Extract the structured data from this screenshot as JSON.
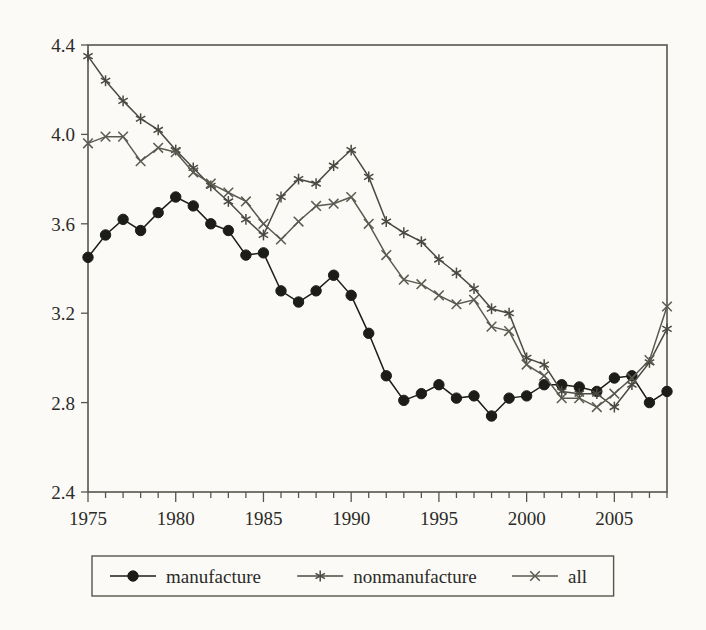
{
  "chart_data": {
    "type": "line",
    "title": "",
    "subtitle": "",
    "xlabel": "",
    "ylabel": "",
    "xlim": [
      1975,
      2008
    ],
    "ylim": [
      2.4,
      4.4
    ],
    "yticks": [
      2.4,
      2.8,
      3.2,
      3.6,
      4.0,
      4.4
    ],
    "ytick_labels": [
      "2.4",
      "2.8",
      "3.2",
      "3.6",
      "4.0",
      "4.4"
    ],
    "xticks": [
      1975,
      1980,
      1985,
      1990,
      1995,
      2000,
      2005
    ],
    "xtick_labels": [
      "1975",
      "1980",
      "1985",
      "1990",
      "1995",
      "2000",
      "2005"
    ],
    "minor_xtick_interval": 1,
    "grid": false,
    "legend_position": "bottom",
    "x": [
      1975,
      1976,
      1977,
      1978,
      1979,
      1980,
      1981,
      1982,
      1983,
      1984,
      1985,
      1986,
      1987,
      1988,
      1989,
      1990,
      1991,
      1992,
      1993,
      1994,
      1995,
      1996,
      1997,
      1998,
      1999,
      2000,
      2001,
      2002,
      2003,
      2004,
      2005,
      2006,
      2007,
      2008
    ],
    "series": [
      {
        "name": "manufacture",
        "marker": "filled-circle",
        "color": "#1c1c18",
        "values": [
          3.45,
          3.55,
          3.62,
          3.57,
          3.65,
          3.72,
          3.68,
          3.6,
          3.57,
          3.46,
          3.47,
          3.3,
          3.25,
          3.3,
          3.37,
          3.28,
          3.11,
          2.92,
          2.81,
          2.84,
          2.88,
          2.82,
          2.83,
          2.74,
          2.82,
          2.83,
          2.88,
          2.88,
          2.87,
          2.85,
          2.91,
          2.92,
          2.8,
          2.85
        ]
      },
      {
        "name": "nonmanufacture",
        "marker": "asterisk",
        "color": "#4a4a42",
        "values": [
          4.35,
          4.24,
          4.15,
          4.07,
          4.02,
          3.93,
          3.85,
          3.77,
          3.7,
          3.62,
          3.55,
          3.72,
          3.8,
          3.78,
          3.86,
          3.93,
          3.81,
          3.61,
          3.56,
          3.52,
          3.44,
          3.38,
          3.31,
          3.22,
          3.2,
          3.0,
          2.97,
          2.85,
          2.84,
          2.84,
          2.78,
          2.88,
          2.98,
          3.13
        ]
      },
      {
        "name": "all",
        "marker": "x-cross",
        "color": "#5a5a50",
        "values": [
          3.96,
          3.99,
          3.99,
          3.88,
          3.94,
          3.92,
          3.83,
          3.78,
          3.74,
          3.7,
          3.6,
          3.53,
          3.61,
          3.68,
          3.69,
          3.72,
          3.6,
          3.46,
          3.35,
          3.33,
          3.28,
          3.24,
          3.26,
          3.14,
          3.12,
          2.97,
          2.92,
          2.82,
          2.82,
          2.78,
          2.84,
          2.91,
          2.99,
          3.23
        ]
      }
    ]
  },
  "legend": {
    "items": [
      {
        "label": "manufacture",
        "marker": "filled-circle"
      },
      {
        "label": "nonmanufacture",
        "marker": "asterisk"
      },
      {
        "label": "all",
        "marker": "x-cross"
      }
    ]
  }
}
